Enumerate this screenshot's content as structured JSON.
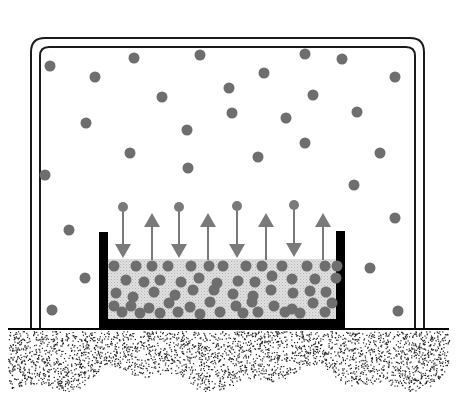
{
  "diagram": {
    "colors": {
      "molecule": "#6e6e6e",
      "arrow": "#7a7a7a",
      "liquid": "#d9d9d9",
      "container": "#000000",
      "bell_jar": "#1a1a1a",
      "ground_dots": "#222222"
    },
    "bell_jar": {
      "outer": {
        "x": 31,
        "y": 38,
        "w": 393,
        "h": 290,
        "r": 14
      },
      "inner": {
        "x": 40,
        "y": 47,
        "w": 375,
        "h": 281,
        "r": 9
      }
    },
    "dish": {
      "left_x": 99,
      "right_x": 345,
      "top_y": 232,
      "bottom_y": 328,
      "wall": 9,
      "liquid_top": 259
    },
    "vapor_molecules": [
      [
        50,
        66
      ],
      [
        95,
        77
      ],
      [
        134,
        58
      ],
      [
        200,
        55
      ],
      [
        305,
        54
      ],
      [
        342,
        59
      ],
      [
        395,
        77
      ],
      [
        162,
        97
      ],
      [
        229,
        88
      ],
      [
        264,
        73
      ],
      [
        313,
        95
      ],
      [
        357,
        112
      ],
      [
        86,
        123
      ],
      [
        187,
        130
      ],
      [
        232,
        113
      ],
      [
        286,
        118
      ],
      [
        258,
        157
      ],
      [
        130,
        153
      ],
      [
        188,
        168
      ],
      [
        305,
        143
      ],
      [
        380,
        153
      ],
      [
        45,
        175
      ],
      [
        354,
        185
      ],
      [
        69,
        230
      ],
      [
        85,
        278
      ],
      [
        52,
        310
      ],
      [
        370,
        268
      ],
      [
        395,
        218
      ],
      [
        398,
        311
      ]
    ],
    "liquid_molecules": [
      [
        114,
        266
      ],
      [
        136,
        266
      ],
      [
        152,
        266
      ],
      [
        168,
        266
      ],
      [
        191,
        266
      ],
      [
        209,
        266
      ],
      [
        223,
        266
      ],
      [
        246,
        266
      ],
      [
        262,
        266
      ],
      [
        282,
        266
      ],
      [
        307,
        266
      ],
      [
        325,
        266
      ],
      [
        337,
        266
      ],
      [
        126,
        280
      ],
      [
        144,
        282
      ],
      [
        160,
        280
      ],
      [
        181,
        282
      ],
      [
        199,
        278
      ],
      [
        217,
        283
      ],
      [
        238,
        281
      ],
      [
        255,
        282
      ],
      [
        272,
        276
      ],
      [
        292,
        279
      ],
      [
        315,
        279
      ],
      [
        336,
        278
      ],
      [
        116,
        293
      ],
      [
        133,
        297
      ],
      [
        154,
        292
      ],
      [
        175,
        295
      ],
      [
        193,
        290
      ],
      [
        214,
        290
      ],
      [
        233,
        294
      ],
      [
        253,
        296
      ],
      [
        271,
        290
      ],
      [
        293,
        293
      ],
      [
        310,
        291
      ],
      [
        326,
        292
      ],
      [
        114,
        306
      ],
      [
        131,
        306
      ],
      [
        149,
        308
      ],
      [
        169,
        303
      ],
      [
        190,
        307
      ],
      [
        210,
        302
      ],
      [
        236,
        306
      ],
      [
        252,
        302
      ],
      [
        274,
        306
      ],
      [
        292,
        309
      ],
      [
        313,
        303
      ],
      [
        332,
        303
      ],
      [
        122,
        312
      ],
      [
        140,
        313
      ],
      [
        160,
        313
      ],
      [
        178,
        312
      ],
      [
        200,
        314
      ],
      [
        220,
        312
      ],
      [
        243,
        313
      ],
      [
        258,
        312
      ],
      [
        285,
        312
      ],
      [
        300,
        313
      ],
      [
        325,
        312
      ]
    ],
    "arrows": [
      {
        "direction": "down",
        "x": 123,
        "y1": 207,
        "y2": 258
      },
      {
        "direction": "up",
        "x": 152,
        "y1": 260,
        "y2": 213
      },
      {
        "direction": "down",
        "x": 179,
        "y1": 207,
        "y2": 258
      },
      {
        "direction": "up",
        "x": 208,
        "y1": 260,
        "y2": 213
      },
      {
        "direction": "down",
        "x": 237,
        "y1": 206,
        "y2": 258
      },
      {
        "direction": "up",
        "x": 266,
        "y1": 260,
        "y2": 213
      },
      {
        "direction": "down",
        "x": 294,
        "y1": 205,
        "y2": 257
      },
      {
        "direction": "up",
        "x": 323,
        "y1": 260,
        "y2": 213
      }
    ],
    "ground": {
      "top_y": 329,
      "left_x": 8,
      "right_x": 449
    }
  }
}
